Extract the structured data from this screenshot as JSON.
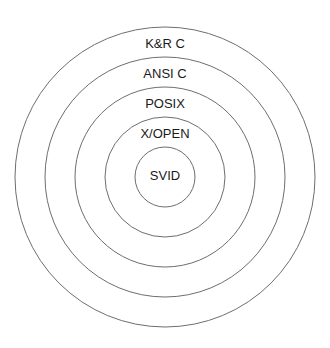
{
  "diagram": {
    "type": "concentric-circles",
    "center": {
      "x": 165,
      "y": 177
    },
    "line_color": "#6e6e6e",
    "text_color": "#1a1a1a",
    "rings": [
      {
        "label": "K&R C",
        "radius": 150,
        "label_y": 45
      },
      {
        "label": "ANSI C",
        "radius": 120,
        "label_y": 75
      },
      {
        "label": "POSIX",
        "radius": 90,
        "label_y": 105
      },
      {
        "label": "X/OPEN",
        "radius": 60,
        "label_y": 135
      },
      {
        "label": "SVID",
        "radius": 30,
        "label_y": 177
      }
    ]
  }
}
